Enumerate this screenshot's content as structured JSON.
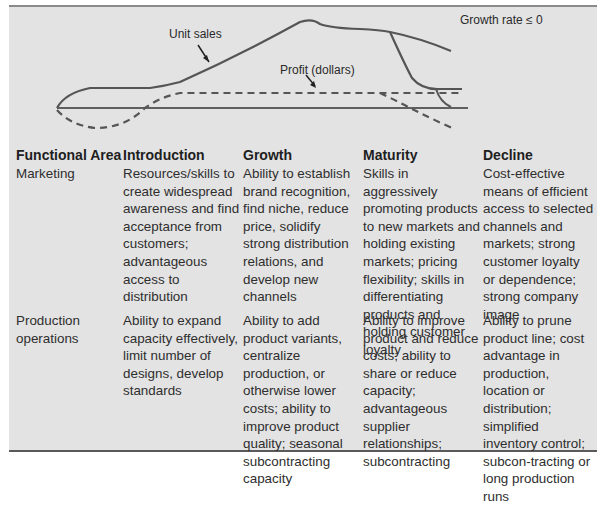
{
  "chart": {
    "labels": {
      "unit_sales": "Unit sales",
      "profit": "Profit (dollars)",
      "growth_rate": "Growth rate ≤ 0"
    },
    "series": [
      {
        "name": "Unit sales",
        "style": "solid",
        "color": "#555555"
      },
      {
        "name": "Profit (dollars)",
        "style": "dashed",
        "color": "#555555"
      }
    ],
    "axis": "horizontal baseline (zero)"
  },
  "table": {
    "headers": [
      "Functional Area",
      "Introduction",
      "Growth",
      "Maturity",
      "Decline"
    ],
    "rows": [
      {
        "area": "Marketing",
        "introduction": "Resources/skills to create widespread awareness and find acceptance from customers; advantageous access to distribution",
        "growth": "Ability to establish brand recognition, find niche, reduce price, solidify strong distribution relations, and develop new channels",
        "maturity": "Skills in aggressively promoting products to new markets and holding existing markets; pricing flexibility; skills in differentiating products and holding customer loyalty",
        "decline": "Cost-effective means of efficient access to selected channels and markets; strong customer loyalty or dependence; strong company image"
      },
      {
        "area": "Production operations",
        "introduction": "Ability to expand capacity effectively, limit number of designs, develop standards",
        "growth": "Ability to add product variants, centralize production, or otherwise lower costs; ability to improve product quality; seasonal subcontracting capacity",
        "maturity": "Ability to improve product and reduce costs; ability to share or reduce capacity; advantageous supplier relationships; subcontracting",
        "decline": "Ability to prune product line; cost advantage in production, location or distribution; simplified inventory control; subcon-tracting or long production runs"
      }
    ]
  }
}
